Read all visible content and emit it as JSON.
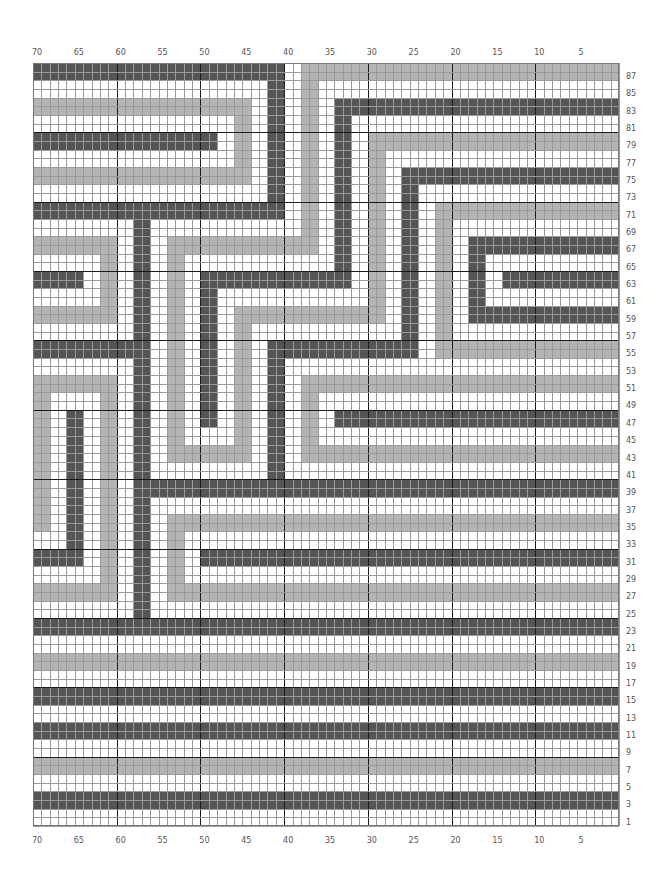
{
  "chart_data": {
    "type": "heatmap",
    "title": "",
    "grid": {
      "columns": 70,
      "rows": 88,
      "major_every": 10,
      "column_numbering": "right-to-left (1 at right, 70 at left)",
      "row_numbering": "bottom-to-top (1 at bottom, 88 at top)"
    },
    "colors": {
      "background": "#ffffff",
      "dark": "#555555",
      "light": "#b4b4b4",
      "minor_grid": "#9a9a9a",
      "major_grid": "#1a1a1a"
    },
    "legend": [],
    "x_tick_labels": [
      "70",
      "65",
      "60",
      "55",
      "50",
      "45",
      "40",
      "35",
      "30",
      "25",
      "20",
      "15",
      "10",
      "5"
    ],
    "y_tick_labels": [
      "87",
      "85",
      "83",
      "81",
      "79",
      "77",
      "75",
      "73",
      "71",
      "69",
      "67",
      "65",
      "63",
      "61",
      "59",
      "57",
      "55",
      "53",
      "51",
      "49",
      "47",
      "45",
      "43",
      "41",
      "39",
      "37",
      "35",
      "33",
      "31",
      "29",
      "27",
      "25",
      "23",
      "21",
      "19",
      "17",
      "15",
      "13",
      "11",
      "9",
      "7",
      "5",
      "3",
      "1"
    ],
    "rect_coordinate_note": "c0 = stitch 70 (left), r0 = row 88 (top); [c_start, r_start, c_end, r_end] inclusive",
    "rects": [
      {
        "color": "dark",
        "box": [
          0,
          0,
          29,
          1
        ]
      },
      {
        "color": "dark",
        "box": [
          28,
          0,
          29,
          17
        ]
      },
      {
        "color": "dark",
        "box": [
          0,
          16,
          29,
          17
        ]
      },
      {
        "color": "light",
        "box": [
          0,
          4,
          25,
          5
        ]
      },
      {
        "color": "light",
        "box": [
          24,
          4,
          25,
          13
        ]
      },
      {
        "color": "light",
        "box": [
          0,
          12,
          25,
          13
        ]
      },
      {
        "color": "dark",
        "box": [
          0,
          8,
          21,
          9
        ]
      },
      {
        "color": "light",
        "box": [
          32,
          0,
          69,
          1
        ]
      },
      {
        "color": "light",
        "box": [
          32,
          0,
          33,
          21
        ]
      },
      {
        "color": "light",
        "box": [
          16,
          20,
          33,
          21
        ]
      },
      {
        "color": "light",
        "box": [
          16,
          20,
          17,
          45
        ]
      },
      {
        "color": "light",
        "box": [
          16,
          44,
          25,
          45
        ]
      },
      {
        "color": "light",
        "box": [
          24,
          28,
          25,
          45
        ]
      },
      {
        "color": "light",
        "box": [
          24,
          28,
          41,
          29
        ]
      },
      {
        "color": "light",
        "box": [
          40,
          8,
          41,
          29
        ]
      },
      {
        "color": "light",
        "box": [
          40,
          8,
          69,
          9
        ]
      },
      {
        "color": "dark",
        "box": [
          36,
          4,
          69,
          5
        ]
      },
      {
        "color": "dark",
        "box": [
          36,
          4,
          37,
          25
        ]
      },
      {
        "color": "dark",
        "box": [
          20,
          24,
          37,
          25
        ]
      },
      {
        "color": "dark",
        "box": [
          20,
          24,
          21,
          41
        ]
      },
      {
        "color": "dark",
        "box": [
          44,
          12,
          69,
          13
        ]
      },
      {
        "color": "dark",
        "box": [
          44,
          12,
          45,
          33
        ]
      },
      {
        "color": "dark",
        "box": [
          28,
          32,
          45,
          33
        ]
      },
      {
        "color": "dark",
        "box": [
          28,
          32,
          29,
          49
        ]
      },
      {
        "color": "light",
        "box": [
          48,
          16,
          69,
          17
        ]
      },
      {
        "color": "light",
        "box": [
          48,
          16,
          49,
          33
        ]
      },
      {
        "color": "light",
        "box": [
          48,
          32,
          69,
          33
        ]
      },
      {
        "color": "dark",
        "box": [
          52,
          20,
          69,
          21
        ]
      },
      {
        "color": "dark",
        "box": [
          52,
          20,
          53,
          29
        ]
      },
      {
        "color": "dark",
        "box": [
          52,
          28,
          69,
          29
        ]
      },
      {
        "color": "dark",
        "box": [
          56,
          24,
          69,
          25
        ]
      },
      {
        "color": "light",
        "box": [
          32,
          36,
          69,
          37
        ]
      },
      {
        "color": "light",
        "box": [
          32,
          36,
          33,
          45
        ]
      },
      {
        "color": "light",
        "box": [
          32,
          44,
          69,
          45
        ]
      },
      {
        "color": "dark",
        "box": [
          36,
          40,
          69,
          41
        ]
      },
      {
        "color": "dark",
        "box": [
          12,
          18,
          13,
          65
        ]
      },
      {
        "color": "dark",
        "box": [
          12,
          48,
          69,
          49
        ]
      },
      {
        "color": "light",
        "box": [
          0,
          20,
          9,
          21
        ]
      },
      {
        "color": "light",
        "box": [
          8,
          20,
          9,
          29
        ]
      },
      {
        "color": "light",
        "box": [
          0,
          28,
          9,
          29
        ]
      },
      {
        "color": "dark",
        "box": [
          0,
          24,
          5,
          25
        ]
      },
      {
        "color": "dark",
        "box": [
          0,
          32,
          13,
          33
        ]
      },
      {
        "color": "light",
        "box": [
          0,
          36,
          9,
          37
        ]
      },
      {
        "color": "light",
        "box": [
          0,
          36,
          1,
          53
        ]
      },
      {
        "color": "light",
        "box": [
          8,
          36,
          9,
          61
        ]
      },
      {
        "color": "light",
        "box": [
          0,
          60,
          9,
          61
        ]
      },
      {
        "color": "dark",
        "box": [
          4,
          40,
          5,
          57
        ]
      },
      {
        "color": "dark",
        "box": [
          0,
          56,
          5,
          57
        ]
      },
      {
        "color": "light",
        "box": [
          16,
          52,
          69,
          53
        ]
      },
      {
        "color": "light",
        "box": [
          16,
          52,
          17,
          61
        ]
      },
      {
        "color": "light",
        "box": [
          16,
          60,
          69,
          61
        ]
      },
      {
        "color": "dark",
        "box": [
          20,
          56,
          69,
          57
        ]
      },
      {
        "color": "dark",
        "box": [
          0,
          64,
          69,
          65
        ]
      },
      {
        "color": "light",
        "box": [
          0,
          68,
          69,
          69
        ]
      },
      {
        "color": "dark",
        "box": [
          0,
          72,
          69,
          73
        ]
      },
      {
        "color": "dark",
        "box": [
          0,
          76,
          69,
          77
        ]
      },
      {
        "color": "light",
        "box": [
          0,
          80,
          69,
          81
        ]
      },
      {
        "color": "dark",
        "box": [
          0,
          84,
          69,
          85
        ]
      }
    ]
  }
}
